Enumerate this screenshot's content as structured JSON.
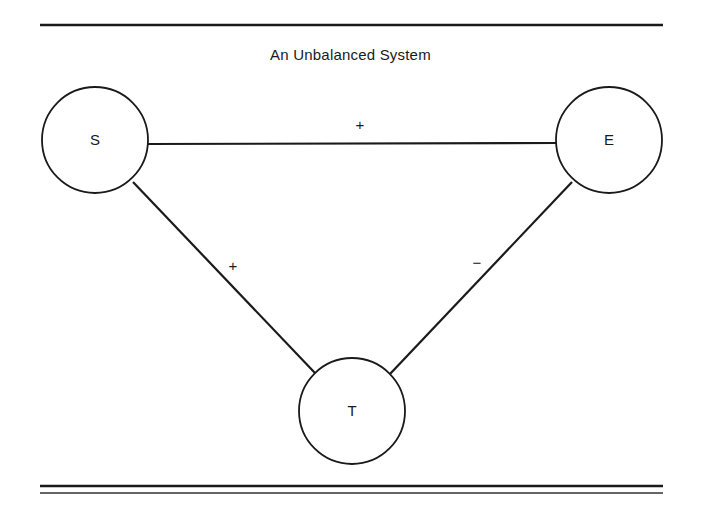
{
  "title": "An Unbalanced System",
  "nodes": [
    {
      "id": "S",
      "label": "S",
      "cx": 95,
      "cy": 140,
      "r": 53
    },
    {
      "id": "E",
      "label": "E",
      "cx": 609,
      "cy": 140,
      "r": 53
    },
    {
      "id": "T",
      "label": "T",
      "cx": 352,
      "cy": 411,
      "r": 53
    }
  ],
  "edges": [
    {
      "from": "S",
      "to": "E",
      "sign": "+"
    },
    {
      "from": "S",
      "to": "T",
      "sign": "+"
    },
    {
      "from": "E",
      "to": "T",
      "sign": "−"
    }
  ],
  "colors": {
    "stroke": "#1a1a1a",
    "background": "#ffffff"
  }
}
